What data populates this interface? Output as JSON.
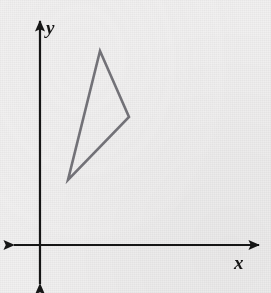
{
  "figure": {
    "width": 271,
    "height": 293,
    "background_color": "#f1f0f0"
  },
  "axes": {
    "color": "#161616",
    "stroke_width": 2.2,
    "arrowheads": [
      "up",
      "down",
      "left",
      "right"
    ],
    "origin": {
      "x": 40,
      "y": 245
    },
    "x_axis": {
      "x_start": 14,
      "x_end": 259,
      "y": 245
    },
    "y_axis": {
      "x": 40,
      "y_start": 21,
      "y_end": 284
    },
    "x_label": {
      "text": "x",
      "left": 234,
      "top": 253,
      "font_size": 19
    },
    "y_label": {
      "text": "y",
      "left": 46,
      "top": 18,
      "font_size": 19
    }
  },
  "chart_data": {
    "type": "scatter",
    "xlabel": "x",
    "ylabel": "y",
    "grid": false,
    "legend": null,
    "annotations": [],
    "shapes": [
      {
        "name": "triangle",
        "kind": "polygon",
        "closed": true,
        "stroke_color": "#75747a",
        "fill": "none",
        "stroke_width": 2.6,
        "pixel_vertices": [
          {
            "label": "apex",
            "x": 100,
            "y": 51
          },
          {
            "label": "right",
            "x": 129,
            "y": 117
          },
          {
            "label": "bottom-left",
            "x": 68,
            "y": 180
          }
        ],
        "pixel_points_attr": "100,51 129,117 68,180",
        "data_vertices": [
          {
            "label": "apex",
            "x": 3.0,
            "y": 7.8
          },
          {
            "label": "right",
            "x": 5.0,
            "y": 5.1
          },
          {
            "label": "bottom-left",
            "x": 1.9,
            "y": 2.7
          }
        ]
      }
    ],
    "xlim": [
      -1.1,
      15.0
    ],
    "ylim": [
      -1.6,
      9.2
    ]
  }
}
